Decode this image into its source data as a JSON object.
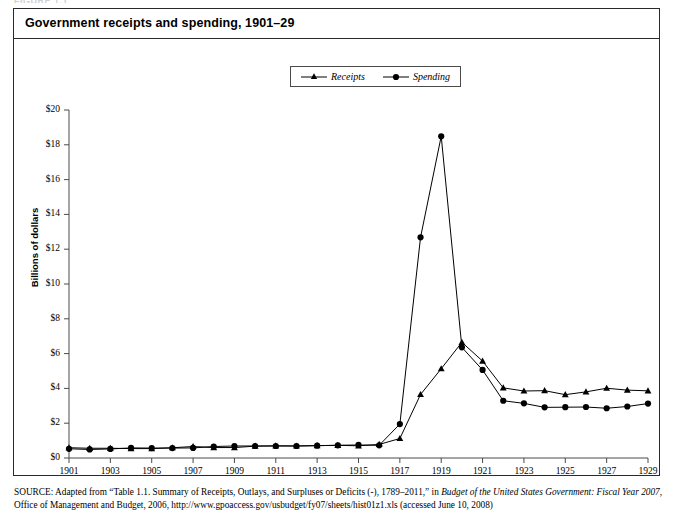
{
  "figure": {
    "caption_cut": "FIGURE 1.1",
    "title": "Government receipts and spending, 1901–29"
  },
  "legend": {
    "position": "top-center",
    "entries": [
      {
        "label": "Receipts",
        "marker": "triangle-marker-icon",
        "color": "#000000"
      },
      {
        "label": "Spending",
        "marker": "circle-marker-icon",
        "color": "#000000"
      }
    ]
  },
  "axes": {
    "y_title": "Billions of dollars",
    "y_ticks": [
      "$0",
      "$2",
      "$4",
      "$6",
      "$8",
      "$10",
      "$12",
      "$14",
      "$16",
      "$18",
      "$20"
    ],
    "x_ticks": [
      "1901",
      "1903",
      "1905",
      "1907",
      "1909",
      "1911",
      "1913",
      "1915",
      "1917",
      "1919",
      "1921",
      "1923",
      "1925",
      "1927",
      "1929"
    ]
  },
  "source": {
    "label": "SOURCE:",
    "text_1": " Adapted from “Table 1.1. Summary of Receipts, Outlays, and Surpluses or Deficits (-), 1789–2011,” in ",
    "italic_1": "Budget of the United States Government: Fiscal Year 2007",
    "text_2": ", Office of Management and Budget, 2006, http://www.gpoaccess.gov/usbudget/fy07/sheets/hist01z1.xls (accessed June 10, 2008)"
  },
  "chart_data": {
    "type": "line",
    "title": "Government receipts and spending, 1901–29",
    "xlabel": "",
    "ylabel": "Billions of dollars",
    "xlim": [
      1901,
      1929
    ],
    "ylim": [
      0,
      20
    ],
    "ytick_step": 2,
    "xtick_step": 2,
    "grid": false,
    "legend_position": "top-center",
    "x": [
      1901,
      1902,
      1903,
      1904,
      1905,
      1906,
      1907,
      1908,
      1909,
      1910,
      1911,
      1912,
      1913,
      1914,
      1915,
      1916,
      1917,
      1918,
      1919,
      1920,
      1921,
      1922,
      1923,
      1924,
      1925,
      1926,
      1927,
      1928,
      1929
    ],
    "series": [
      {
        "name": "Receipts",
        "marker": "triangle",
        "color": "#000000",
        "values": [
          0.59,
          0.56,
          0.56,
          0.54,
          0.54,
          0.59,
          0.66,
          0.6,
          0.6,
          0.68,
          0.7,
          0.69,
          0.71,
          0.73,
          0.7,
          0.78,
          1.12,
          3.65,
          5.13,
          6.65,
          5.57,
          4.03,
          3.85,
          3.87,
          3.64,
          3.8,
          4.01,
          3.9,
          3.86
        ]
      },
      {
        "name": "Spending",
        "marker": "circle",
        "color": "#000000",
        "values": [
          0.53,
          0.49,
          0.52,
          0.58,
          0.57,
          0.57,
          0.58,
          0.66,
          0.69,
          0.69,
          0.69,
          0.69,
          0.71,
          0.73,
          0.75,
          0.73,
          1.95,
          12.68,
          18.49,
          6.36,
          5.06,
          3.29,
          3.14,
          2.91,
          2.92,
          2.93,
          2.86,
          2.96,
          3.13
        ]
      }
    ]
  }
}
